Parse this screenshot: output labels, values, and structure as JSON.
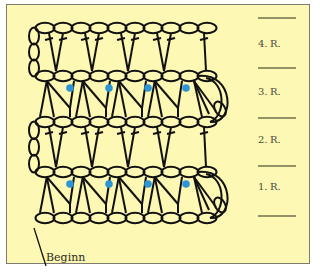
{
  "diagram": {
    "colors": {
      "background": "#fdf8b3",
      "border": "#7d7b70",
      "stroke": "#111111",
      "dot": "#2b95d6",
      "label": "#4a4a3a"
    },
    "rows": [
      {
        "label": "4. R.",
        "label_y": 38
      },
      {
        "label": "3. R.",
        "label_y": 86
      },
      {
        "label": "2. R.",
        "label_y": 134
      },
      {
        "label": "1. R.",
        "label_y": 181
      }
    ],
    "divider_lines_y": [
      18,
      68,
      118,
      166,
      216
    ],
    "start_label": "Beginn",
    "chain_rows_y": [
      28,
      76,
      122,
      172,
      218
    ],
    "chain_count": 10,
    "chain_x_start": 36,
    "chain_width": 18,
    "dot_rows_y": [
      88,
      184
    ],
    "dot_x": [
      70,
      109,
      148,
      186
    ]
  }
}
